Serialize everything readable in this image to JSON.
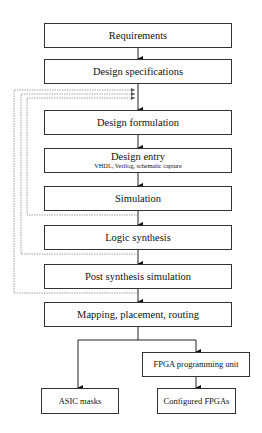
{
  "diagram": {
    "type": "flowchart",
    "nodes": [
      {
        "id": "requirements",
        "label": "Requirements"
      },
      {
        "id": "design_specifications",
        "label": "Design specifications"
      },
      {
        "id": "design_formulation",
        "label": "Design formulation"
      },
      {
        "id": "design_entry",
        "label": "Design entry",
        "sublabel": "VHDL, Verilog, schematic capture"
      },
      {
        "id": "simulation",
        "label": "Simulation"
      },
      {
        "id": "logic_synthesis",
        "label": "Logic synthesis"
      },
      {
        "id": "post_synthesis_simulation",
        "label": "Post synthesis simulation"
      },
      {
        "id": "mapping",
        "label": "Mapping, placement, routing"
      },
      {
        "id": "fpga_programming_unit",
        "label": "FPGA programming unit"
      },
      {
        "id": "asic_masks",
        "label": "ASIC masks"
      },
      {
        "id": "configured_fpgas",
        "label": "Configured FPGAs"
      }
    ],
    "edges": [
      {
        "from": "requirements",
        "to": "design_specifications",
        "style": "solid"
      },
      {
        "from": "design_specifications",
        "to": "design_formulation",
        "style": "solid"
      },
      {
        "from": "design_formulation",
        "to": "design_entry",
        "style": "solid"
      },
      {
        "from": "design_entry",
        "to": "simulation",
        "style": "solid"
      },
      {
        "from": "simulation",
        "to": "logic_synthesis",
        "style": "solid"
      },
      {
        "from": "logic_synthesis",
        "to": "post_synthesis_simulation",
        "style": "solid"
      },
      {
        "from": "post_synthesis_simulation",
        "to": "mapping",
        "style": "solid"
      },
      {
        "from": "mapping",
        "to": "asic_masks",
        "style": "solid"
      },
      {
        "from": "mapping",
        "to": "fpga_programming_unit",
        "style": "solid"
      },
      {
        "from": "fpga_programming_unit",
        "to": "configured_fpgas",
        "style": "solid"
      },
      {
        "from": "simulation",
        "to": "design_formulation",
        "style": "dotted-feedback"
      },
      {
        "from": "logic_synthesis",
        "to": "design_formulation",
        "style": "dotted-feedback"
      },
      {
        "from": "post_synthesis_simulation",
        "to": "design_formulation",
        "style": "dotted-feedback"
      }
    ],
    "colors": {
      "line": "#222222",
      "feedback": "#888888",
      "box_border": "#333333"
    }
  }
}
